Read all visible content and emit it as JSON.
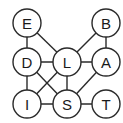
{
  "diagram": {
    "type": "undirected-graph",
    "nodes": [
      {
        "id": "E",
        "label": "E",
        "x": 27,
        "y": 23
      },
      {
        "id": "B",
        "label": "B",
        "x": 106,
        "y": 23
      },
      {
        "id": "D",
        "label": "D",
        "x": 27,
        "y": 62
      },
      {
        "id": "L",
        "label": "L",
        "x": 67,
        "y": 62
      },
      {
        "id": "A",
        "label": "A",
        "x": 106,
        "y": 62
      },
      {
        "id": "I",
        "label": "I",
        "x": 27,
        "y": 104
      },
      {
        "id": "S",
        "label": "S",
        "x": 67,
        "y": 104
      },
      {
        "id": "T",
        "label": "T",
        "x": 106,
        "y": 104
      }
    ],
    "edges": [
      [
        "E",
        "D"
      ],
      [
        "E",
        "L"
      ],
      [
        "B",
        "L"
      ],
      [
        "B",
        "A"
      ],
      [
        "D",
        "L"
      ],
      [
        "D",
        "I"
      ],
      [
        "D",
        "S"
      ],
      [
        "L",
        "A"
      ],
      [
        "L",
        "I"
      ],
      [
        "L",
        "S"
      ],
      [
        "A",
        "S"
      ],
      [
        "I",
        "S"
      ],
      [
        "S",
        "T"
      ]
    ],
    "node_radius": 14,
    "stroke_color": "#2a2a2a",
    "fill_color": "#ffffff"
  }
}
